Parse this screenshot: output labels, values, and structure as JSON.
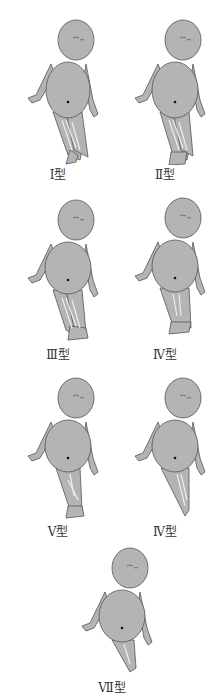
{
  "figure": {
    "fill_color": "#b4b4b4",
    "outline_color": "#555555",
    "panels": [
      {
        "label": "Ⅰ型",
        "legs": "both-lanugo",
        "feet": "crossed"
      },
      {
        "label": "Ⅱ型",
        "legs": "both-lanugo",
        "feet": "fused"
      },
      {
        "label": "Ⅲ型",
        "legs": "both-lanugo",
        "feet": "separate"
      },
      {
        "label": "Ⅳ型",
        "legs": "fused-upper",
        "feet": "fused"
      },
      {
        "label": "Ⅴ型",
        "legs": "fused",
        "feet": "small"
      },
      {
        "label": "Ⅳ型",
        "legs": "fused-tapered",
        "feet": "none"
      },
      {
        "label": "Ⅶ型",
        "legs": "fused-short",
        "feet": "none"
      }
    ]
  }
}
